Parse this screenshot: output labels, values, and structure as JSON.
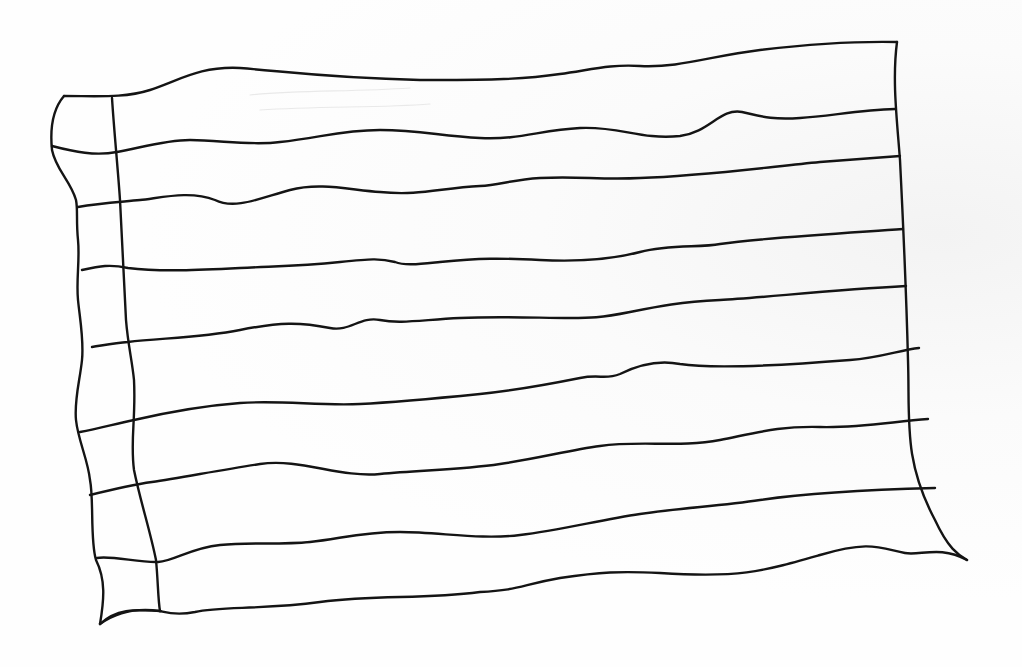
{
  "drawing": {
    "subject": "hand-drawn waving striped flag outline",
    "stroke_color": "#141414",
    "background_color": "#fdfdfd",
    "stripe_count": 9,
    "outline": {
      "top": "M 64 96 C 100 96, 125 98, 150 90 C 180 80, 200 66, 240 68 C 290 72, 330 78, 420 80 C 480 80, 520 80, 560 74 C 590 70, 610 64, 640 66 C 680 68, 710 56, 760 50 C 810 44, 850 41, 897 42",
      "right": "M 897 42 C 892 80, 897 120, 900 160 C 903 220, 906 280, 908 360 C 910 420, 903 460, 935 520 C 948 548, 958 555, 967 560",
      "bottom": "M 967 560 C 940 545, 920 556, 905 553 C 880 548, 870 540, 820 555 C 760 572, 740 578, 660 573 C 620 571, 600 572, 560 578 C 520 585, 520 590, 480 592 C 420 600, 380 594, 320 602 C 260 610, 220 606, 195 612 C 175 616, 165 612, 160 611",
      "bottom_hoist": "M 160 611 C 145 611, 120 605, 100 624",
      "left": "M 100 624 C 104 600, 106 580, 96 560 C 90 540, 94 500, 90 480 C 88 460, 78 440, 76 420 C 74 400, 80 380, 82 360 C 84 340, 80 320, 78 300 C 76 280, 80 260, 78 240 C 76 220, 78 210, 76 200 C 70 180, 56 170, 52 150 C 50 130, 52 110, 64 96"
    },
    "hoist_divider": "M 112 98 C 114 130, 118 170, 120 200 C 122 240, 124 280, 126 320 C 128 345, 132 360, 134 380 C 136 420, 130 440, 134 470 C 140 500, 150 530, 156 560 C 158 580, 158 600, 160 611",
    "stripe_lines": [
      "M 52 146 C 75 152, 95 156, 117 152 C 140 148, 165 140, 190 140 C 220 140, 250 146, 280 142 C 320 138, 340 130, 380 130 C 420 130, 440 136, 480 138 C 520 140, 540 130, 580 128 C 620 126, 640 140, 680 136 C 710 132, 720 108, 742 112 C 760 116, 770 120, 800 118 C 830 116, 860 110, 895 109",
      "M 78 207 C 100 203, 120 202, 140 200 C 160 198, 190 190, 215 200 C 235 210, 260 198, 290 190 C 320 182, 350 190, 380 192 C 420 196, 440 188, 480 186 C 500 185, 510 180, 540 178 C 580 176, 600 180, 640 178 C 700 176, 760 168, 820 162 C 850 160, 870 158, 900 156",
      "M 82 270 C 100 266, 110 264, 128 268 C 160 272, 200 270, 240 268 C 280 266, 300 266, 340 262 C 370 259, 380 258, 395 262 C 405 266, 420 264, 440 262 C 480 258, 500 258, 540 260 C 580 262, 610 260, 640 252 C 670 244, 700 248, 720 244 C 760 238, 830 234, 903 229",
      "M 92 347 C 105 345, 115 343, 128 342 C 160 338, 200 338, 240 330 C 280 322, 300 322, 330 328 C 350 332, 360 316, 380 320 C 400 324, 420 320, 460 318 C 500 316, 540 318, 570 318 C 590 318, 600 318, 630 312 C 660 306, 680 302, 720 300 C 760 298, 830 290, 906 286",
      "M 80 432 C 100 428, 115 424, 134 420 C 160 414, 200 406, 240 403 C 280 400, 320 406, 360 404 C 400 402, 440 398, 480 394 C 520 390, 550 384, 580 378 C 600 374, 605 380, 620 374 C 640 364, 660 360, 680 364 C 720 370, 800 364, 850 360 C 880 358, 900 350, 919 348",
      "M 90 495 C 110 490, 130 485, 152 482 C 180 478, 220 470, 260 464 C 300 458, 340 478, 380 474 C 420 470, 460 470, 500 464 C 540 458, 570 450, 600 446 C 640 440, 680 448, 720 440 C 760 432, 780 426, 820 427 C 860 428, 890 422, 928 419",
      "M 97 558 C 110 555, 140 563, 158 562 C 175 561, 190 548, 220 545 C 250 542, 280 545, 310 542 C 340 539, 360 532, 400 532 C 440 532, 480 540, 520 535 C 560 530, 600 520, 640 514 C 680 508, 720 506, 760 500 C 800 494, 860 490, 935 488",
      "M 100 624 C 120 610, 140 608, 160 611"
    ],
    "ghost_marks": [
      "M 250 95 C 300 90, 350 92, 410 88",
      "M 260 110 C 320 106, 380 108, 430 104"
    ]
  }
}
